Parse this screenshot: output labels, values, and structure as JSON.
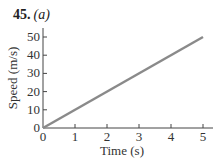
{
  "figure": {
    "number": "45.",
    "part": "(a)"
  },
  "chart_data": {
    "type": "line",
    "xlabel": "Time (s)",
    "ylabel": "Speed (m/s)",
    "xlim": [
      0,
      5
    ],
    "ylim": [
      0,
      55
    ],
    "xticks": [
      0,
      1,
      2,
      3,
      4,
      5
    ],
    "yticks": [
      0,
      10,
      20,
      30,
      40,
      50
    ],
    "grid": false,
    "legend": null,
    "series": [
      {
        "name": "Speed",
        "color": "#8a8a8a",
        "x": [
          0,
          5
        ],
        "y": [
          0,
          50
        ]
      }
    ]
  }
}
